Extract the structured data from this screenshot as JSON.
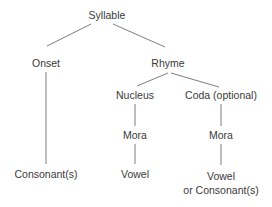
{
  "diagram": {
    "type": "tree",
    "line_color": "#6e6e6e",
    "text_color": "#3a3a3a",
    "nodes": {
      "syllable": "Syllable",
      "onset": "Onset",
      "rhyme": "Rhyme",
      "nucleus": "Nucleus",
      "coda": "Coda (optional)",
      "mora_nucleus": "Mora",
      "mora_coda": "Mora",
      "consonants": "Consonant(s)",
      "vowel": "Vowel",
      "coda_leaf_line1": "Vowel",
      "coda_leaf_line2": "or Consonant(s)"
    },
    "edges": [
      [
        "syllable",
        "onset"
      ],
      [
        "syllable",
        "rhyme"
      ],
      [
        "onset",
        "consonants"
      ],
      [
        "rhyme",
        "nucleus"
      ],
      [
        "rhyme",
        "coda"
      ],
      [
        "nucleus",
        "mora_nucleus"
      ],
      [
        "mora_nucleus",
        "vowel"
      ],
      [
        "coda",
        "mora_coda"
      ],
      [
        "mora_coda",
        "coda_leaf"
      ]
    ]
  }
}
